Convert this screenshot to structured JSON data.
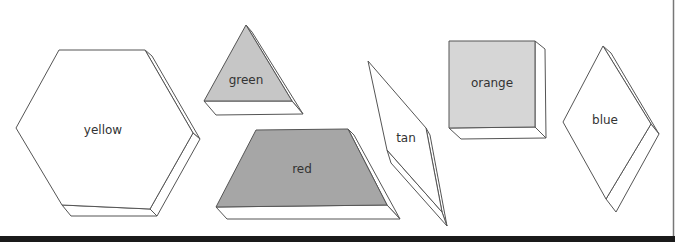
{
  "diagram": {
    "shapes": [
      {
        "id": "hexagon",
        "label": "yellow",
        "fill": "#ffffff"
      },
      {
        "id": "triangle",
        "label": "green",
        "fill": "#c6c6c6"
      },
      {
        "id": "trapezoid",
        "label": "red",
        "fill": "#a6a6a6"
      },
      {
        "id": "thin-rhombus",
        "label": "tan",
        "fill": "#ffffff"
      },
      {
        "id": "square",
        "label": "orange",
        "fill": "#d6d6d6"
      },
      {
        "id": "rhombus",
        "label": "blue",
        "fill": "#ffffff"
      }
    ],
    "frame": {
      "border_color": "#1a1a1a",
      "right_border_color": "#666666"
    }
  }
}
